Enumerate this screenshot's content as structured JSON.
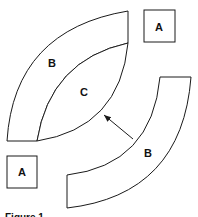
{
  "figure": {
    "caption": "Figure 1",
    "labels": {
      "square_top_right": "A",
      "square_bottom_left": "A",
      "band_top": "B",
      "lens_center": "C",
      "band_bottom": "B"
    },
    "colors": {
      "stroke": "#1a1a1a",
      "fill": "#ffffff"
    }
  }
}
